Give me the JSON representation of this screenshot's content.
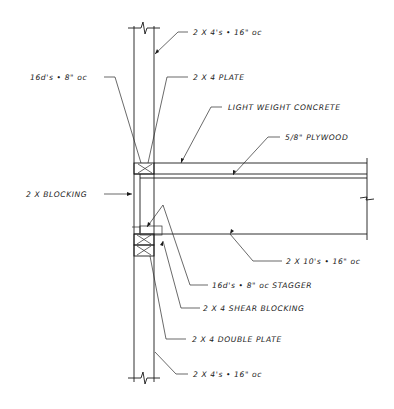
{
  "drawing": {
    "type": "wall-floor section detail",
    "callouts": [
      {
        "id": "studs_top",
        "text": "2 X 4's • 16\" oc"
      },
      {
        "id": "nails_top",
        "text": "16d's • 8\" oc"
      },
      {
        "id": "plate_top",
        "text": "2 X 4 PLATE"
      },
      {
        "id": "concrete",
        "text": "LIGHT WEIGHT CONCRETE"
      },
      {
        "id": "plywood",
        "text": "5/8\" PLYWOOD"
      },
      {
        "id": "blocking",
        "text": "2 X BLOCKING"
      },
      {
        "id": "joists",
        "text": "2 X 10's • 16\" oc"
      },
      {
        "id": "nails_stagger",
        "text": "16d's • 8\" oc STAGGER"
      },
      {
        "id": "shear_blocking",
        "text": "2 X 4 SHEAR BLOCKING"
      },
      {
        "id": "double_plate",
        "text": "2 X 4 DOUBLE PLATE"
      },
      {
        "id": "studs_bottom",
        "text": "2 X 4's • 16\" oc"
      }
    ],
    "colors": {
      "line": "#1a1a1a",
      "background": "#ffffff"
    }
  }
}
